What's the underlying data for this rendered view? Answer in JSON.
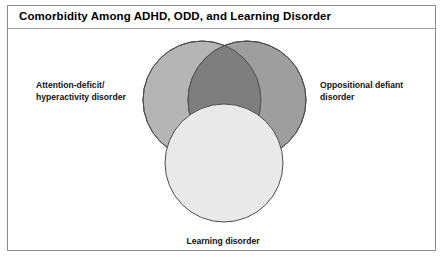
{
  "figure": {
    "title": "Comorbidity Among ADHD, ODD, and Learning Disorder",
    "background_color": "#ffffff",
    "frame_color": "#8a8a8a"
  },
  "diagram": {
    "type": "venn-three-circle",
    "outline_color": "#4d4d4d",
    "circles": [
      {
        "id": "adhd",
        "label": "Attention-deficit/\nhyperactivity disorder",
        "label_line1": "Attention-deficit/",
        "label_line2": "hyperactivity disorder",
        "fill_color": "#b5b5b5",
        "cx": 202,
        "cy": 100,
        "r": 59,
        "label_position": "left"
      },
      {
        "id": "odd",
        "label": "Oppositional defiant disorder",
        "label_line1": "Oppositional defiant",
        "label_line2": "disorder",
        "fill_color": "#9e9e9e",
        "cx": 247,
        "cy": 100,
        "r": 59,
        "label_position": "right"
      },
      {
        "id": "learning",
        "label": "Learning disorder",
        "label_line1": "Learning disorder",
        "label_line2": "",
        "fill_color": "#e9e9e9",
        "cx": 224,
        "cy": 163,
        "r": 59,
        "label_position": "bottom"
      }
    ],
    "overlap_colors": {
      "adhd_odd": "#7e7e7e",
      "with_learning": "#e9e9e9"
    }
  }
}
